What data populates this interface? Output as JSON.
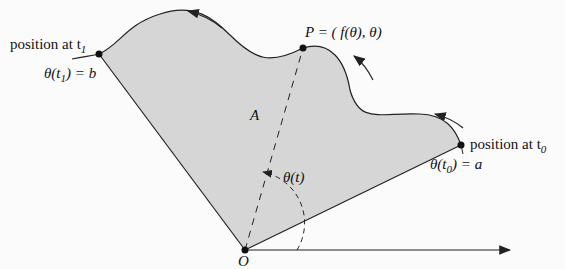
{
  "diagram": {
    "type": "polar-area-region",
    "colors": {
      "fill": "#d6d6d6",
      "stroke": "#222222",
      "background": "#fbfbfb"
    },
    "labels": {
      "start_position": "position at t",
      "start_sub": "1",
      "start_angle": "θ(t",
      "start_angle_sub": "1",
      "start_angle_val": ") = b",
      "point_P": "P = ( f(θ), θ)",
      "area": "A",
      "theta_t": "θ(t)",
      "end_position": "position at t",
      "end_sub": "0",
      "end_angle": "θ(t",
      "end_angle_sub": "0",
      "end_angle_val": ") = a",
      "origin": "O"
    }
  }
}
